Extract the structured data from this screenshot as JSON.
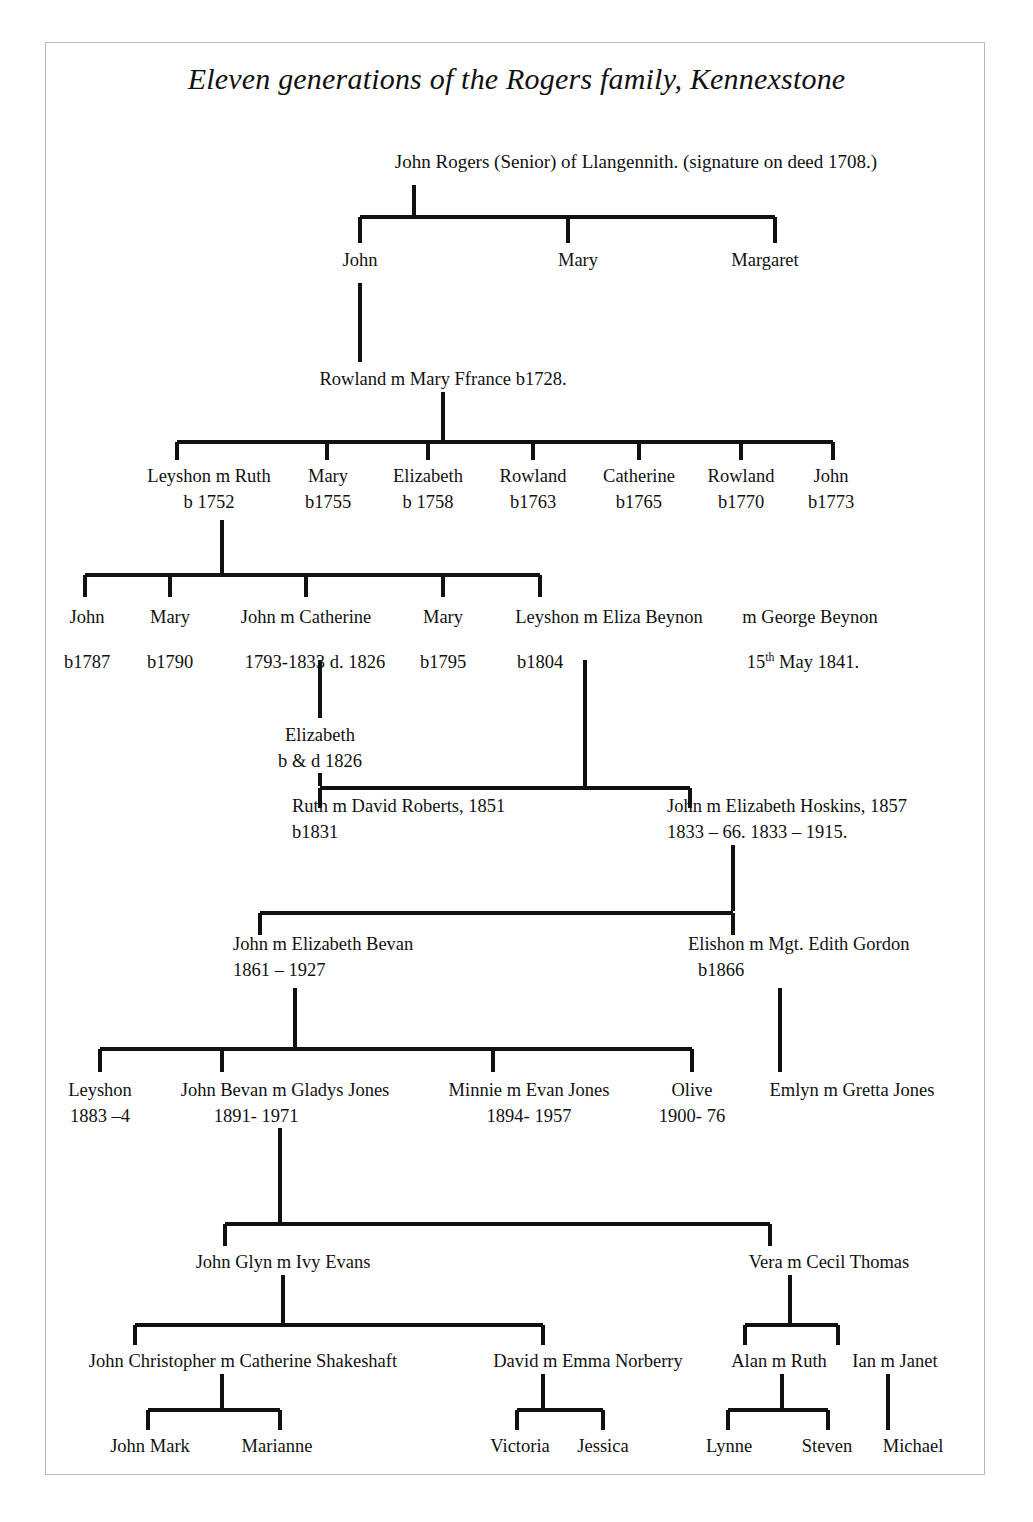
{
  "document": {
    "title": "Eleven generations of the Rogers family, Kennexstone",
    "frame_color": "#b9b9b9",
    "ink_color": "#111111",
    "background": "#ffffff"
  },
  "generations": {
    "g1": {
      "root": {
        "name": "John Rogers (Senior) of Llangennith. (signature on deed 1708.)"
      }
    },
    "g2": {
      "john": {
        "name": "John"
      },
      "mary": {
        "name": "Mary"
      },
      "margaret": {
        "name": "Margaret"
      }
    },
    "g3": {
      "rowland": {
        "name": "Rowland m Mary Ffrance b1728."
      }
    },
    "g4": {
      "leyshon": {
        "name": "Leyshon m Ruth",
        "dates": "b 1752"
      },
      "mary1755": {
        "name": "Mary",
        "dates": "b1755"
      },
      "elizabeth1758": {
        "name": "Elizabeth",
        "dates": "b 1758"
      },
      "rowland1763": {
        "name": "Rowland",
        "dates": "b1763"
      },
      "catherine1765": {
        "name": "Catherine",
        "dates": "b1765"
      },
      "rowland1770": {
        "name": "Rowland",
        "dates": "b1770"
      },
      "john1773": {
        "name": "John",
        "dates": "b1773"
      }
    },
    "g5": {
      "john1787": {
        "name": "John",
        "dates": "b1787"
      },
      "mary1790": {
        "name": "Mary",
        "dates": "b1790"
      },
      "john_catherine": {
        "name": "John m Catherine",
        "dates": "1793-1833 d. 1826"
      },
      "mary1795": {
        "name": "Mary",
        "dates": "b1795"
      },
      "leyshon_eliza": {
        "name": "Leyshon m Eliza Beynon",
        "dates": "b1804"
      },
      "george_beynon": {
        "name": "m George Beynon",
        "dates_pre": "15",
        "dates_sup": "th",
        "dates_post": " May 1841."
      }
    },
    "g6": {
      "elizabeth1826": {
        "name": "Elizabeth",
        "dates": "b & d 1826"
      },
      "ruth_david": {
        "name": "Ruth m David Roberts, 1851",
        "dates": "b1831"
      },
      "john_hoskins": {
        "name": "John m Elizabeth Hoskins, 1857",
        "dates": "1833 – 66.     1833 – 1915."
      }
    },
    "g7": {
      "john_bevan_eliz": {
        "name": "John m Elizabeth Bevan",
        "dates": "1861 – 1927"
      },
      "elishon_gordon": {
        "name": "Elishon m Mgt. Edith Gordon",
        "dates": "b1866"
      }
    },
    "g8": {
      "leyshon1883": {
        "name": "Leyshon",
        "dates": "1883 –4"
      },
      "john_bevan_gladys": {
        "name": "John Bevan m Gladys Jones",
        "dates": "1891- 1971"
      },
      "minnie_evan": {
        "name": "Minnie m Evan Jones",
        "dates": "1894- 1957"
      },
      "olive": {
        "name": "Olive",
        "dates": "1900- 76"
      },
      "emlyn_gretta": {
        "name": "Emlyn m Gretta Jones",
        "dates": ""
      }
    },
    "g9": {
      "john_glyn_ivy": {
        "name": "John Glyn m Ivy Evans"
      },
      "vera_cecil": {
        "name": "Vera m Cecil Thomas"
      }
    },
    "g10": {
      "john_christopher": {
        "name": "John Christopher m Catherine Shakeshaft"
      },
      "david_emma": {
        "name": "David m Emma Norberry"
      },
      "alan_ruth": {
        "name": "Alan m Ruth"
      },
      "ian_janet": {
        "name": "Ian m Janet"
      }
    },
    "g11": {
      "john_mark": {
        "name": "John Mark"
      },
      "marianne": {
        "name": "Marianne"
      },
      "victoria": {
        "name": "Victoria"
      },
      "jessica": {
        "name": "Jessica"
      },
      "lynne": {
        "name": "Lynne"
      },
      "steven": {
        "name": "Steven"
      },
      "michael": {
        "name": "Michael"
      }
    }
  }
}
